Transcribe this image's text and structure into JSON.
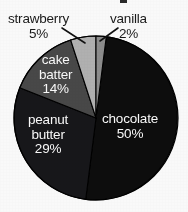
{
  "chart_data": {
    "type": "pie",
    "title": "",
    "xlabel": "",
    "ylabel": "",
    "legend": "none",
    "grid": false,
    "units": "percent",
    "categories": [
      "chocolate",
      "peanut butter",
      "cake batter",
      "strawberry",
      "vanilla"
    ],
    "values": [
      50,
      29,
      14,
      5,
      2
    ],
    "slices": [
      {
        "name": "chocolate",
        "label": "chocolate",
        "percent": 50,
        "percent_label": "50%",
        "color": "#0d0d0d",
        "label_placement": "inside",
        "label_color": "#ffffff",
        "start_angle_deg": 7.2,
        "end_angle_deg": 187.2
      },
      {
        "name": "peanut-butter",
        "label_line1": "peanut",
        "label_line2": "butter",
        "label": "peanut butter",
        "percent": 29,
        "percent_label": "29%",
        "color": "#17171a",
        "label_placement": "inside",
        "label_color": "#ffffff",
        "start_angle_deg": 187.2,
        "end_angle_deg": 291.6
      },
      {
        "name": "cake-batter",
        "label_line1": "cake",
        "label_line2": "batter",
        "label": "cake batter",
        "percent": 14,
        "percent_label": "14%",
        "color": "#494949",
        "label_placement": "inside",
        "label_color": "#ffffff",
        "start_angle_deg": 291.6,
        "end_angle_deg": 342.0
      },
      {
        "name": "strawberry",
        "label": "strawberry",
        "percent": 5,
        "percent_label": "5%",
        "color": "#b4b4b4",
        "label_placement": "outside",
        "label_color": "#1a1a1a",
        "start_angle_deg": 342.0,
        "end_angle_deg": 360.0
      },
      {
        "name": "vanilla",
        "label": "vanilla",
        "percent": 2,
        "percent_label": "2%",
        "color": "#8f8f8f",
        "label_placement": "outside",
        "label_color": "#1a1a1a",
        "start_angle_deg": 0.0,
        "end_angle_deg": 7.2
      }
    ],
    "geometry": {
      "center_x": 96,
      "center_y": 118,
      "radius": 82
    },
    "leader_lines": [
      {
        "name": "strawberry-leader",
        "x1": 62,
        "y1": 28,
        "x2": 85,
        "y2": 43
      },
      {
        "name": "vanilla-leader",
        "x1": 118,
        "y1": 28,
        "x2": 100,
        "y2": 41
      }
    ],
    "colors": {
      "background": "#ffffff",
      "outline": "#000000",
      "inside_label_text": "#ffffff",
      "outside_label_text": "#1a1a1a"
    }
  }
}
